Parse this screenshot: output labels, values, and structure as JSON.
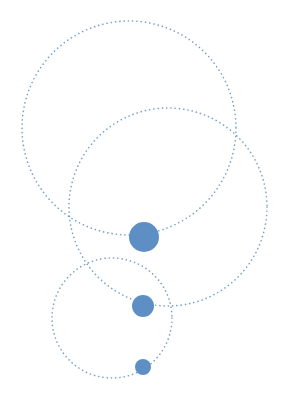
{
  "diagram": {
    "width": 288,
    "height": 407,
    "background": "#ffffff",
    "orbit_color": "#5b8fb8",
    "dot_color": "#5d8fc4",
    "orbits": [
      {
        "name": "orbit-large",
        "cx": 129,
        "cy": 128,
        "r": 107
      },
      {
        "name": "orbit-medium",
        "cx": 168,
        "cy": 207,
        "r": 99
      },
      {
        "name": "orbit-small",
        "cx": 112,
        "cy": 318,
        "r": 60
      }
    ],
    "dots": [
      {
        "name": "dot-large",
        "cx": 144,
        "cy": 237,
        "r": 15
      },
      {
        "name": "dot-medium",
        "cx": 143,
        "cy": 306,
        "r": 11
      },
      {
        "name": "dot-small",
        "cx": 143,
        "cy": 367,
        "r": 8
      }
    ]
  }
}
